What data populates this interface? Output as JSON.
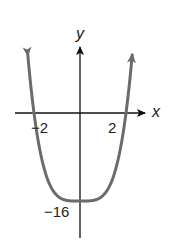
{
  "chart_data": {
    "type": "line",
    "title": "",
    "xlabel": "x",
    "ylabel": "y",
    "function_hint": "quartic, symmetric about y-axis, minimum at (0, -16), x-intercepts at -2 and 2 (e.g. y = x^4 - 16)",
    "x_tick_labels": [
      "-2",
      "2"
    ],
    "y_tick_labels": [
      "-16"
    ],
    "xlim": [
      -2.8,
      2.8
    ],
    "ylim": [
      -19,
      15
    ],
    "grid": false,
    "legend": null,
    "series": [
      {
        "name": "curve",
        "x": [
          -2.25,
          -2.0,
          -1.75,
          -1.5,
          -1.25,
          -1.0,
          -0.5,
          0.0,
          0.5,
          1.0,
          1.25,
          1.5,
          1.75,
          2.0,
          2.25
        ],
        "y": [
          9.63,
          0.0,
          -6.62,
          -10.94,
          -13.56,
          -15.0,
          -15.94,
          -16.0,
          -15.94,
          -15.0,
          -13.56,
          -10.94,
          -6.62,
          0.0,
          9.63
        ],
        "arrows_at_ends": true
      }
    ],
    "colors": {
      "curve": "#6b6b6b",
      "axes": "#111111"
    }
  },
  "labels": {
    "x_axis": "x",
    "y_axis": "y",
    "x_tick_neg": "−2",
    "x_tick_pos": "2",
    "y_tick_min": "−16"
  }
}
